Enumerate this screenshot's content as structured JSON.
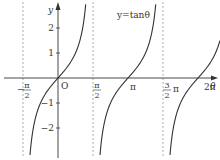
{
  "chart_data": {
    "type": "line",
    "title": "y=tanθ",
    "function": "tan",
    "xlabel": "θ",
    "ylabel": "y",
    "origin_label": "O",
    "x_ticks": [
      {
        "value": -1.5708,
        "label_num": "π",
        "label_den": "2",
        "sign": "−",
        "kind": "frac"
      },
      {
        "value": 1.5708,
        "label_num": "π",
        "label_den": "2",
        "sign": "",
        "kind": "frac"
      },
      {
        "value": 3.1416,
        "label": "π",
        "kind": "plain"
      },
      {
        "value": 4.7124,
        "label_num": "3",
        "label_den": "2",
        "suffix": "π",
        "kind": "frac"
      },
      {
        "value": 6.2832,
        "label": "2π",
        "kind": "plain"
      }
    ],
    "y_ticks": [
      {
        "value": 2,
        "label": "2"
      },
      {
        "value": 1,
        "label": "1"
      },
      {
        "value": -1,
        "label": "−1"
      },
      {
        "value": -2,
        "label": "−2"
      }
    ],
    "asymptotes": [
      -1.5708,
      1.5708,
      4.7124
    ],
    "xlim": [
      -1.8,
      6.8
    ],
    "ylim": [
      -3.2,
      3.1
    ],
    "grid": false,
    "legend": null,
    "curve_color": "#333333",
    "axis_color": "#333333",
    "asymptote_color": "#999999"
  }
}
